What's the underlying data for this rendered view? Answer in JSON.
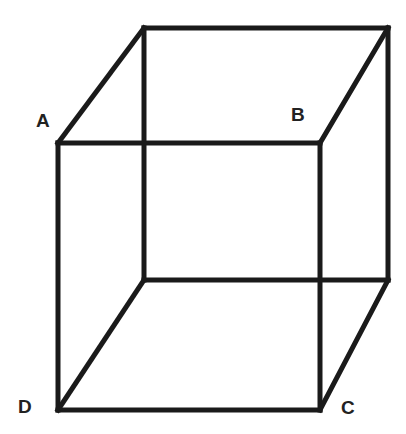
{
  "diagram": {
    "type": "wireframe-cube",
    "labels": {
      "A": "A",
      "B": "B",
      "C": "C",
      "D": "D"
    },
    "front_face": {
      "A": [
        58,
        143
      ],
      "B": [
        320,
        143
      ],
      "C": [
        320,
        410
      ],
      "D": [
        58,
        410
      ]
    },
    "back_face": {
      "top_left": [
        144,
        28
      ],
      "top_right": [
        388,
        28
      ],
      "bottom_right": [
        388,
        280
      ],
      "bottom_left": [
        144,
        280
      ]
    },
    "colors": {
      "line": "#1a1a1a",
      "label": "#222222",
      "background": "#ffffff"
    }
  }
}
